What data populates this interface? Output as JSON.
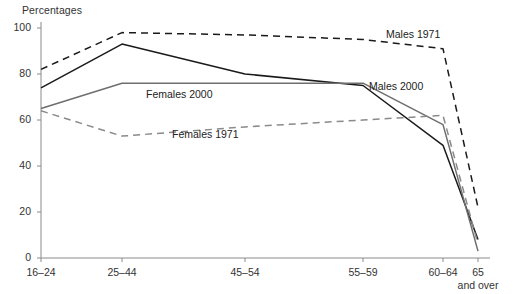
{
  "chart_data": {
    "type": "line",
    "title": "",
    "ylabel": "Percentages",
    "xlabel": "",
    "ylim": [
      0,
      100
    ],
    "yticks": [
      0,
      20,
      40,
      60,
      80,
      100
    ],
    "ytick_labels": [
      "0",
      "20",
      "40",
      "60",
      "80",
      "100"
    ],
    "categories": [
      "16–24",
      "25–44",
      "45–54",
      "55–59",
      "60–64",
      "65"
    ],
    "xtick_sublabel": "and over",
    "grid": false,
    "legend": "inline-annotations",
    "series": [
      {
        "name": "Males 1971",
        "values": [
          82,
          98,
          97,
          95,
          91,
          22
        ],
        "color": "#1a1a1a",
        "style": "dashed",
        "label_x": 386,
        "label_y": 28
      },
      {
        "name": "Males 2000",
        "values": [
          74,
          93,
          80,
          75,
          49,
          8
        ],
        "color": "#1a1a1a",
        "style": "solid",
        "label_x": 369,
        "label_y": 80
      },
      {
        "name": "Females 2000",
        "values": [
          65,
          76,
          76,
          76,
          58,
          3
        ],
        "color": "#6e6e6e",
        "style": "solid",
        "label_x": 146,
        "label_y": 88
      },
      {
        "name": "Females 1971",
        "values": [
          64,
          53,
          57,
          60,
          62,
          6
        ],
        "color": "#8a8a8a",
        "style": "dashed",
        "label_x": 172,
        "label_y": 128
      }
    ]
  },
  "axis": {
    "y_title": "Percentages",
    "tick_color": "#8a8a8a",
    "line_color": "#8a8a8a"
  }
}
